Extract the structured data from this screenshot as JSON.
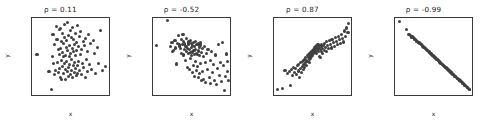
{
  "figure": {
    "background_color": "#ffffff",
    "marker_color": "#404040",
    "axis_color": "#3a3a3a",
    "panel_count": 4
  },
  "chart_data": [
    {
      "type": "scatter",
      "title": "ρ = 0.11",
      "xlabel": "x",
      "ylabel": "y",
      "grid": false,
      "legend": "none",
      "xlim": [
        -3.0,
        2.8
      ],
      "ylim": [
        -2.7,
        2.8
      ],
      "xticks": [
        -2,
        -1,
        0,
        1,
        2
      ],
      "yticks": [
        -2,
        -1,
        0,
        1,
        2
      ],
      "correlation": 0.11,
      "n_points": 100,
      "x": [
        -2.62,
        -1.72,
        -1.55,
        -1.45,
        -1.42,
        -1.38,
        -1.33,
        -1.3,
        -1.22,
        -1.18,
        -1.12,
        -1.08,
        -1.02,
        -0.98,
        -0.95,
        -0.92,
        -0.9,
        -0.88,
        -0.85,
        -0.82,
        -0.8,
        -0.78,
        -0.75,
        -0.72,
        -0.7,
        -0.68,
        -0.65,
        -0.62,
        -0.6,
        -0.58,
        -0.55,
        -0.52,
        -0.5,
        -0.48,
        -0.45,
        -0.42,
        -0.4,
        -0.38,
        -0.35,
        -0.32,
        -0.3,
        -0.28,
        -0.25,
        -0.22,
        -0.2,
        -0.18,
        -0.15,
        -0.12,
        -0.1,
        -0.08,
        -0.05,
        -0.02,
        0.0,
        0.02,
        0.05,
        0.08,
        0.1,
        0.12,
        0.15,
        0.18,
        0.2,
        0.22,
        0.25,
        0.28,
        0.3,
        0.32,
        0.35,
        0.38,
        0.4,
        0.42,
        0.45,
        0.48,
        0.5,
        0.55,
        0.58,
        0.62,
        0.65,
        0.7,
        0.75,
        0.8,
        0.85,
        0.9,
        0.95,
        1.0,
        1.05,
        1.1,
        1.15,
        1.2,
        1.28,
        1.35,
        1.42,
        1.5,
        1.6,
        1.7,
        1.8,
        1.9,
        2.0,
        2.15,
        2.3,
        2.55
      ],
      "y": [
        0.22,
        -1.05,
        -2.32,
        0.05,
        1.62,
        -0.48,
        -1.22,
        0.88,
        -0.92,
        2.22,
        1.28,
        -0.35,
        0.52,
        -1.12,
        1.95,
        0.18,
        -0.78,
        2.05,
        -1.42,
        0.62,
        1.1,
        -0.25,
        -1.58,
        0.35,
        1.72,
        -0.68,
        0.02,
        -1.18,
        0.95,
        2.35,
        -0.42,
        1.38,
        -0.88,
        0.15,
        -1.62,
        0.72,
        1.18,
        -0.32,
        2.48,
        -1.02,
        0.45,
        -0.72,
        1.55,
        -1.35,
        0.08,
        0.82,
        -0.55,
        1.92,
        -1.25,
        0.28,
        -0.95,
        1.42,
        -0.18,
        0.65,
        -1.48,
        2.12,
        -0.62,
        0.38,
        1.25,
        -1.08,
        0.92,
        -0.38,
        1.68,
        -0.82,
        0.12,
        -1.32,
        1.05,
        0.48,
        -0.58,
        2.28,
        -1.15,
        0.75,
        -0.28,
        1.48,
        -0.92,
        0.22,
        1.82,
        -1.22,
        0.58,
        -0.45,
        1.15,
        -0.72,
        0.85,
        -1.45,
        1.35,
        -0.15,
        0.42,
        -1.05,
        1.62,
        -0.55,
        0.95,
        -0.88,
        1.22,
        0.28,
        -1.18,
        0.68,
        -0.42,
        1.88,
        -0.95,
        -0.65
      ]
    },
    {
      "type": "scatter",
      "title": "ρ = -0.52",
      "xlabel": "x",
      "ylabel": "y",
      "grid": false,
      "legend": "none",
      "xlim": [
        -2.9,
        2.7
      ],
      "ylim": [
        -6.4,
        6.4
      ],
      "xticks": [
        -2,
        -1,
        0,
        1,
        2
      ],
      "yticks": [
        -6,
        -4,
        -2,
        0,
        2,
        4,
        6
      ],
      "correlation": -0.52,
      "n_points": 100,
      "x": [
        -2.62,
        -1.85,
        -1.62,
        -1.52,
        -1.45,
        -1.38,
        -1.3,
        -1.25,
        -1.18,
        -1.12,
        -1.05,
        -1.0,
        -0.95,
        -0.9,
        -0.85,
        -0.8,
        -0.75,
        -0.72,
        -0.68,
        -0.65,
        -0.6,
        -0.58,
        -0.55,
        -0.5,
        -0.48,
        -0.45,
        -0.42,
        -0.38,
        -0.35,
        -0.32,
        -0.3,
        -0.28,
        -0.25,
        -0.22,
        -0.2,
        -0.18,
        -0.15,
        -0.12,
        -0.1,
        -0.08,
        -0.05,
        -0.02,
        0.0,
        0.02,
        0.05,
        0.08,
        0.1,
        0.12,
        0.15,
        0.18,
        0.2,
        0.22,
        0.25,
        0.28,
        0.3,
        0.32,
        0.35,
        0.38,
        0.4,
        0.42,
        0.45,
        0.48,
        0.5,
        0.52,
        0.55,
        0.58,
        0.62,
        0.65,
        0.68,
        0.72,
        0.75,
        0.8,
        0.85,
        0.9,
        0.95,
        1.0,
        1.05,
        1.1,
        1.18,
        1.25,
        1.3,
        1.38,
        1.45,
        1.52,
        1.58,
        1.65,
        1.72,
        1.8,
        1.88,
        1.95,
        2.02,
        2.1,
        2.18,
        2.25,
        2.32,
        2.38,
        2.45,
        2.5,
        2.55,
        2.6
      ],
      "y": [
        1.85,
        5.95,
        1.62,
        2.35,
        0.88,
        1.05,
        2.62,
        1.42,
        -1.25,
        2.18,
        3.45,
        1.75,
        2.05,
        1.38,
        0.52,
        2.85,
        1.92,
        3.72,
        0.25,
        2.42,
        1.15,
        2.08,
        -0.62,
        1.68,
        2.95,
        0.82,
        1.35,
        -1.88,
        2.25,
        0.45,
        1.98,
        2.52,
        -2.15,
        1.22,
        0.68,
        2.72,
        -0.35,
        1.55,
        2.15,
        0.12,
        -2.62,
        1.88,
        0.75,
        2.32,
        -1.45,
        1.02,
        0.38,
        -3.25,
        1.72,
        2.45,
        -0.85,
        1.18,
        0.55,
        -2.35,
        1.92,
        0.28,
        -1.68,
        2.12,
        -3.45,
        0.92,
        1.45,
        -2.88,
        0.15,
        1.82,
        -1.22,
        2.25,
        -4.05,
        0.62,
        1.35,
        -2.52,
        0.05,
        -3.78,
        1.62,
        -1.05,
        -4.25,
        0.48,
        -2.18,
        1.12,
        -3.55,
        -0.72,
        -4.48,
        0.85,
        -2.72,
        -1.35,
        -3.92,
        0.25,
        -4.62,
        -2.05,
        1.95,
        -3.15,
        -0.95,
        -4.18,
        2.38,
        -1.55,
        -5.65,
        -3.35,
        0.42,
        -2.45,
        -0.85,
        -4.05
      ]
    },
    {
      "type": "scatter",
      "title": "ρ = 0.87",
      "xlabel": "x",
      "ylabel": "y",
      "grid": false,
      "legend": "none",
      "xlim": [
        -2.9,
        2.7
      ],
      "ylim": [
        -5.3,
        1.5
      ],
      "xticks": [
        -2,
        -1,
        0,
        1,
        2
      ],
      "yticks": [
        -5,
        -4,
        -3,
        -2,
        -1,
        0,
        1
      ],
      "correlation": 0.87,
      "n_points": 100,
      "x": [
        -2.62,
        -2.25,
        -2.1,
        -1.92,
        -1.8,
        -1.72,
        -1.62,
        -1.55,
        -1.48,
        -1.4,
        -1.35,
        -1.28,
        -1.22,
        -1.15,
        -1.1,
        -1.05,
        -1.0,
        -0.95,
        -0.9,
        -0.85,
        -0.8,
        -0.78,
        -0.75,
        -0.72,
        -0.68,
        -0.65,
        -0.62,
        -0.58,
        -0.55,
        -0.52,
        -0.48,
        -0.45,
        -0.42,
        -0.38,
        -0.35,
        -0.32,
        -0.3,
        -0.28,
        -0.25,
        -0.22,
        -0.2,
        -0.18,
        -0.15,
        -0.12,
        -0.1,
        -0.08,
        -0.05,
        -0.02,
        0.0,
        0.02,
        0.05,
        0.08,
        0.1,
        0.12,
        0.15,
        0.18,
        0.2,
        0.22,
        0.25,
        0.28,
        0.3,
        0.32,
        0.35,
        0.38,
        0.42,
        0.45,
        0.48,
        0.52,
        0.55,
        0.58,
        0.62,
        0.65,
        0.7,
        0.75,
        0.8,
        0.85,
        0.9,
        0.95,
        1.0,
        1.05,
        1.12,
        1.18,
        1.25,
        1.32,
        1.4,
        1.48,
        1.55,
        1.62,
        1.7,
        1.78,
        1.85,
        1.92,
        2.0,
        2.1,
        2.18,
        2.25,
        2.32,
        2.4,
        2.48,
        2.55
      ],
      "y": [
        -4.85,
        -4.72,
        -3.15,
        -3.42,
        -3.25,
        -4.45,
        -3.05,
        -3.58,
        -2.85,
        -3.35,
        -2.95,
        -3.52,
        -2.72,
        -3.18,
        -2.62,
        -3.72,
        -2.45,
        -2.92,
        -3.28,
        -2.35,
        -2.78,
        -3.05,
        -2.22,
        -2.58,
        -2.88,
        -2.15,
        -2.45,
        -1.95,
        -2.68,
        -2.25,
        -1.82,
        -2.38,
        -2.02,
        -1.72,
        -2.18,
        -1.62,
        -2.45,
        -1.88,
        -1.52,
        -2.08,
        -1.72,
        -1.42,
        -1.92,
        -1.58,
        -1.35,
        -1.78,
        -1.48,
        -1.25,
        -1.65,
        -1.38,
        -1.15,
        -1.52,
        -1.28,
        -1.05,
        -1.45,
        -1.18,
        -0.95,
        -1.62,
        -1.32,
        -1.08,
        -0.85,
        -1.42,
        -1.15,
        -1.88,
        -0.95,
        -1.25,
        -2.02,
        -1.05,
        -1.45,
        -0.82,
        -1.18,
        -1.62,
        -0.92,
        -1.35,
        -0.72,
        -1.08,
        -1.45,
        -0.58,
        -0.95,
        -1.22,
        -0.48,
        -0.82,
        -1.15,
        -0.38,
        -0.68,
        -1.02,
        -0.25,
        -0.55,
        -0.88,
        -0.12,
        -0.42,
        -0.75,
        0.05,
        -0.35,
        -0.62,
        0.35,
        -0.15,
        0.62,
        0.18,
        1.05
      ]
    },
    {
      "type": "scatter",
      "title": "ρ = -0.99",
      "xlabel": "x",
      "ylabel": "y",
      "grid": false,
      "legend": "none",
      "xlim": [
        -2.85,
        2.6
      ],
      "ylim": [
        -2.7,
        2.9
      ],
      "xticks": [
        -2,
        -1,
        0,
        1,
        2
      ],
      "yticks": [
        -2,
        -1,
        0,
        1,
        2
      ],
      "correlation": -0.99,
      "n_points": 100,
      "x": [
        -2.52,
        -2.02,
        -1.88,
        -1.82,
        -1.75,
        -1.7,
        -1.65,
        -1.6,
        -1.55,
        -1.5,
        -1.45,
        -1.4,
        -1.35,
        -1.3,
        -1.25,
        -1.2,
        -1.15,
        -1.1,
        -1.05,
        -1.0,
        -0.96,
        -0.92,
        -0.88,
        -0.84,
        -0.8,
        -0.76,
        -0.72,
        -0.68,
        -0.64,
        -0.6,
        -0.56,
        -0.52,
        -0.48,
        -0.44,
        -0.4,
        -0.36,
        -0.32,
        -0.28,
        -0.24,
        -0.2,
        -0.16,
        -0.12,
        -0.08,
        -0.04,
        0.0,
        0.04,
        0.08,
        0.12,
        0.16,
        0.2,
        0.24,
        0.28,
        0.32,
        0.36,
        0.4,
        0.44,
        0.48,
        0.52,
        0.56,
        0.6,
        0.64,
        0.68,
        0.72,
        0.76,
        0.8,
        0.84,
        0.88,
        0.92,
        0.96,
        1.0,
        1.04,
        1.08,
        1.12,
        1.16,
        1.2,
        1.25,
        1.3,
        1.35,
        1.4,
        1.45,
        1.5,
        1.55,
        1.6,
        1.65,
        1.7,
        1.75,
        1.8,
        1.85,
        1.9,
        1.95,
        2.0,
        2.05,
        2.1,
        2.15,
        2.2,
        2.25,
        2.3,
        2.35,
        2.4,
        2.45
      ],
      "y": [
        2.62,
        2.05,
        1.72,
        1.68,
        1.62,
        1.58,
        1.52,
        1.48,
        1.45,
        1.4,
        1.35,
        1.32,
        1.28,
        1.22,
        1.18,
        1.15,
        1.1,
        1.05,
        1.02,
        0.98,
        0.94,
        0.9,
        0.86,
        0.82,
        0.78,
        0.74,
        0.7,
        0.66,
        0.62,
        0.58,
        0.55,
        0.51,
        0.47,
        0.43,
        0.39,
        0.35,
        0.31,
        0.28,
        0.24,
        0.2,
        0.16,
        0.12,
        0.08,
        0.05,
        0.01,
        -0.03,
        -0.07,
        -0.11,
        -0.15,
        -0.18,
        -0.22,
        -0.26,
        -0.3,
        -0.34,
        -0.38,
        -0.41,
        -0.45,
        -0.49,
        -0.53,
        -0.57,
        -0.61,
        -0.64,
        -0.68,
        -0.72,
        -0.76,
        -0.8,
        -0.84,
        -0.87,
        -0.91,
        -0.95,
        -0.99,
        -1.03,
        -1.07,
        -1.1,
        -1.14,
        -1.19,
        -1.24,
        -1.28,
        -1.33,
        -1.38,
        -1.42,
        -1.47,
        -1.52,
        -1.56,
        -1.61,
        -1.66,
        -1.7,
        -1.75,
        -1.8,
        -1.85,
        -1.89,
        -1.94,
        -1.99,
        -2.03,
        -2.08,
        -2.13,
        -2.17,
        -2.22,
        -2.27,
        -2.31
      ]
    }
  ]
}
